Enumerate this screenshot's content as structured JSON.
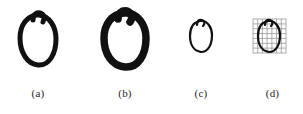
{
  "figure": {
    "type": "handwritten-digit-panels",
    "background_color": "#ffffff",
    "ink_color": "#111111",
    "grid_color": "#8a8a8a",
    "width": 303,
    "height": 114,
    "panel_count": 4,
    "caption_font_size_px": 11
  },
  "panels": [
    {
      "id": "a",
      "caption": "(a)",
      "glyph": "0",
      "description": "handwritten digit zero, medium stroke, original scale",
      "stroke_width_px": 5.0,
      "ellipse": {
        "cx": 38,
        "cy": 40,
        "rx": 17,
        "ry": 25,
        "rotation_deg": -8
      },
      "has_top_hook": true,
      "has_grid_overlay": false,
      "bbox": {
        "x": 20,
        "y": 12,
        "w": 37,
        "h": 54
      },
      "center_x": 38
    },
    {
      "id": "b",
      "caption": "(b)",
      "glyph": "0",
      "description": "handwritten digit zero, thick / dilated stroke",
      "stroke_width_px": 7.5,
      "ellipse": {
        "cx": 125,
        "cy": 39,
        "rx": 20,
        "ry": 27,
        "rotation_deg": -8
      },
      "has_top_hook": true,
      "has_grid_overlay": false,
      "bbox": {
        "x": 103,
        "y": 10,
        "w": 45,
        "h": 58
      },
      "center_x": 125
    },
    {
      "id": "c",
      "caption": "(c)",
      "glyph": "0",
      "description": "handwritten digit zero, thin stroke, reduced scale",
      "stroke_width_px": 2.2,
      "ellipse": {
        "cx": 201,
        "cy": 36,
        "rx": 10,
        "ry": 15,
        "rotation_deg": -8
      },
      "has_top_hook": true,
      "has_grid_overlay": false,
      "bbox": {
        "x": 190,
        "y": 19,
        "w": 23,
        "h": 33
      },
      "center_x": 201
    },
    {
      "id": "d",
      "caption": "(d)",
      "glyph": "0",
      "description": "handwritten digit zero with sampling grid overlay",
      "stroke_width_px": 2.2,
      "ellipse": {
        "cx": 269,
        "cy": 36,
        "rx": 10,
        "ry": 15,
        "rotation_deg": -8
      },
      "has_top_hook": true,
      "has_grid_overlay": true,
      "grid": {
        "x": 253,
        "y": 19,
        "w": 33,
        "h": 34,
        "cols": 7,
        "rows": 7
      },
      "bbox": {
        "x": 253,
        "y": 19,
        "w": 33,
        "h": 34
      },
      "center_x": 269
    }
  ]
}
